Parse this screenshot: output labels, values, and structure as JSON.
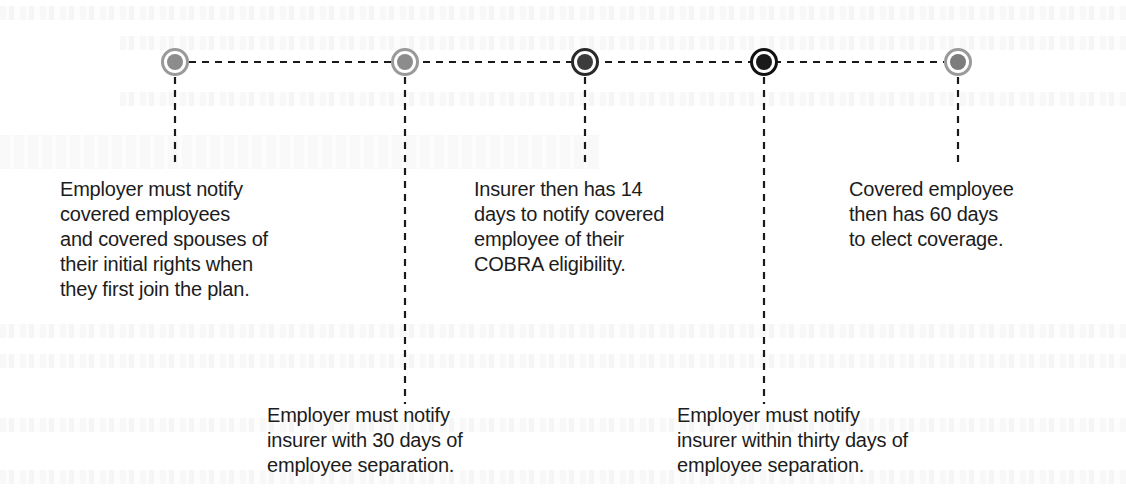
{
  "diagram": {
    "type": "timeline",
    "nodes": [
      {
        "id": "n1",
        "x": 175,
        "y": 62,
        "ring_color": "#9a9a9a",
        "fill_color": "#8c8c8c"
      },
      {
        "id": "n2",
        "x": 405,
        "y": 62,
        "ring_color": "#9a9a9a",
        "fill_color": "#8c8c8c"
      },
      {
        "id": "n3",
        "x": 585,
        "y": 62,
        "ring_color": "#2a2a2a",
        "fill_color": "#3c3c3c"
      },
      {
        "id": "n4",
        "x": 764,
        "y": 62,
        "ring_color": "#111111",
        "fill_color": "#1a1a1a"
      },
      {
        "id": "n5",
        "x": 958,
        "y": 62,
        "ring_color": "#9a9a9a",
        "fill_color": "#7c7c7c"
      }
    ],
    "labels": {
      "step1": "Employer must notify\ncovered employees\nand covered spouses of\ntheir initial rights when\nthey first join the plan.",
      "step2": "Employer must notify\ninsurer with 30 days of\nemployee separation.",
      "step3": "Insurer then has 14\ndays to notify covered\nemployee of their\nCOBRA eligibility.",
      "step4": "Employer must notify\ninsurer within thirty days of\nemployee separation.",
      "step5": "Covered employee\nthen has 60 days\nto elect coverage."
    }
  }
}
